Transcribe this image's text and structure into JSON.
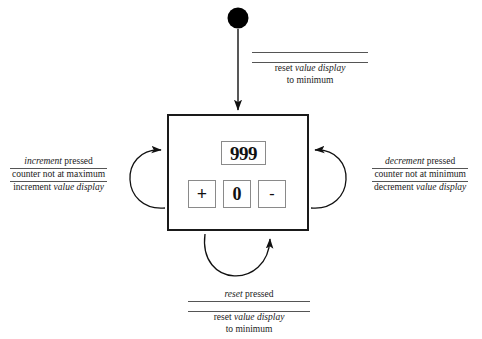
{
  "diagram": {
    "type": "uml-statechart",
    "background_color": "#ffffff",
    "line_color": "#1a1a1a"
  },
  "initial_state": {
    "name": "initial-pseudostate",
    "shape": "filled-circle",
    "color": "#000000"
  },
  "state": {
    "name": "counter-widget-state",
    "border_color": "#1a1a1a",
    "value_display": {
      "label": "999",
      "border_color": "#8a8a8a"
    },
    "buttons": [
      {
        "name": "increment-button",
        "label": "+"
      },
      {
        "name": "reset-button",
        "label": "0"
      },
      {
        "name": "decrement-button",
        "label": "-"
      }
    ]
  },
  "transitions": {
    "initial": {
      "name": "initial-transition",
      "trigger": "",
      "guard": "",
      "action_line1_pre": "reset ",
      "action_line1_em": "value display",
      "action_line2": "to minimum"
    },
    "increment": {
      "name": "increment-self-transition",
      "trigger_em": "increment",
      "trigger_post": " pressed",
      "guard": "counter not at maximum",
      "action_pre": "increment ",
      "action_em": "value display"
    },
    "decrement": {
      "name": "decrement-self-transition",
      "trigger_em": "decrement",
      "trigger_post": " pressed",
      "guard": "counter not at minimum",
      "action_pre": "decrement ",
      "action_em": "value display"
    },
    "reset": {
      "name": "reset-self-transition",
      "trigger_em": "reset",
      "trigger_post": " pressed",
      "guard": "",
      "action_line1_pre": "reset ",
      "action_line1_em": "value display",
      "action_line2": "to minimum"
    }
  }
}
